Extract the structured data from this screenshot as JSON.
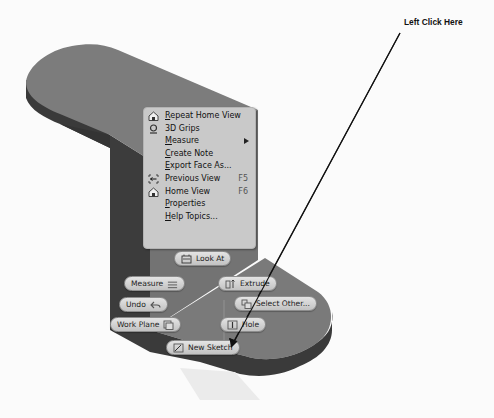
{
  "annotation": {
    "label": "Left Click Here"
  },
  "context_menu": {
    "items": [
      {
        "label_u": "R",
        "label_rest": "epeat Home View",
        "icon": "home-icon",
        "shortcut": ""
      },
      {
        "label_u": "",
        "label_rest": "3D Grips",
        "icon": "grips-icon",
        "shortcut": ""
      },
      {
        "label_u": "M",
        "label_rest": "easure",
        "icon": "",
        "shortcut": "",
        "submenu": true
      },
      {
        "label_u": "C",
        "label_rest": "reate Note",
        "icon": "",
        "shortcut": ""
      },
      {
        "label_u": "E",
        "label_rest": "xport Face As...",
        "icon": "",
        "shortcut": ""
      },
      {
        "label_u": "",
        "label_rest": "Previous View",
        "icon": "previous-view-icon",
        "shortcut": "F5"
      },
      {
        "label_u": "",
        "label_rest": "Home View",
        "icon": "home-icon",
        "shortcut": "F6"
      },
      {
        "label_u": "P",
        "label_rest": "roperties",
        "icon": "",
        "shortcut": ""
      },
      {
        "label_u": "H",
        "label_rest": "elp Topics...",
        "icon": "",
        "shortcut": ""
      }
    ]
  },
  "marking_menu": {
    "look_at": "Look At",
    "measure": "Measure",
    "undo": "Undo",
    "work_plane": "Work Plane",
    "new_sketch": "New Sketch",
    "extrude": "Extrude",
    "select_other": "Select Other...",
    "hole": "Hole"
  },
  "colors": {
    "part_top": "#7b7b7b",
    "part_side": "#3c3c3c",
    "menu_bg": "#c9c9c9",
    "background": "#fbfbfb"
  }
}
